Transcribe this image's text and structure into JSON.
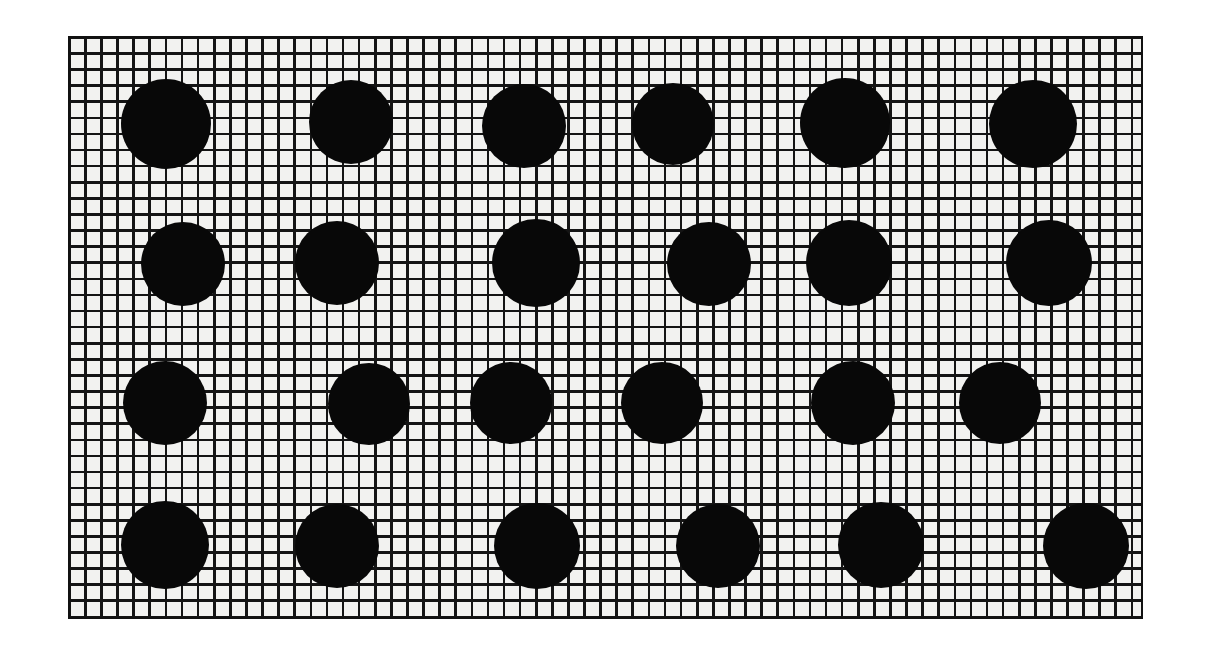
{
  "scene": {
    "title": "Black mesh grid with array of solid black dots",
    "canvas_width": 1207,
    "canvas_height": 662,
    "background_color": "#ffffff"
  },
  "plate": {
    "name": "grid-plate",
    "x": 68,
    "y": 36,
    "width": 1075,
    "height": 583,
    "cell_size": 16.1,
    "line_width": 2.6,
    "line_color": "#141414",
    "cell_color": "#f2f2f0",
    "border_color": "#111111",
    "border_width": 2.6,
    "columns": 67,
    "rows": 36
  },
  "dots": {
    "name": "dot-array",
    "count": 24,
    "rows": 4,
    "columns": 6,
    "color": "#080808",
    "items": [
      {
        "id": "dot-r1c1",
        "row": 1,
        "col": 1,
        "cx": 166,
        "cy": 124,
        "r": 45
      },
      {
        "id": "dot-r1c2",
        "row": 1,
        "col": 2,
        "cx": 351,
        "cy": 122,
        "r": 42
      },
      {
        "id": "dot-r1c3",
        "row": 1,
        "col": 3,
        "cx": 524,
        "cy": 126,
        "r": 42
      },
      {
        "id": "dot-r1c4",
        "row": 1,
        "col": 4,
        "cx": 673,
        "cy": 124,
        "r": 41
      },
      {
        "id": "dot-r1c5",
        "row": 1,
        "col": 5,
        "cx": 845,
        "cy": 123,
        "r": 45
      },
      {
        "id": "dot-r1c6",
        "row": 1,
        "col": 6,
        "cx": 1033,
        "cy": 124,
        "r": 44
      },
      {
        "id": "dot-r2c1",
        "row": 2,
        "col": 1,
        "cx": 183,
        "cy": 264,
        "r": 42
      },
      {
        "id": "dot-r2c2",
        "row": 2,
        "col": 2,
        "cx": 337,
        "cy": 263,
        "r": 42
      },
      {
        "id": "dot-r2c3",
        "row": 2,
        "col": 3,
        "cx": 536,
        "cy": 263,
        "r": 44
      },
      {
        "id": "dot-r2c4",
        "row": 2,
        "col": 4,
        "cx": 709,
        "cy": 264,
        "r": 42
      },
      {
        "id": "dot-r2c5",
        "row": 2,
        "col": 5,
        "cx": 849,
        "cy": 263,
        "r": 43
      },
      {
        "id": "dot-r2c6",
        "row": 2,
        "col": 6,
        "cx": 1049,
        "cy": 263,
        "r": 43
      },
      {
        "id": "dot-r3c1",
        "row": 3,
        "col": 1,
        "cx": 165,
        "cy": 403,
        "r": 42
      },
      {
        "id": "dot-r3c2",
        "row": 3,
        "col": 2,
        "cx": 369,
        "cy": 404,
        "r": 41
      },
      {
        "id": "dot-r3c3",
        "row": 3,
        "col": 3,
        "cx": 511,
        "cy": 403,
        "r": 41
      },
      {
        "id": "dot-r3c4",
        "row": 3,
        "col": 4,
        "cx": 662,
        "cy": 403,
        "r": 41
      },
      {
        "id": "dot-r3c5",
        "row": 3,
        "col": 5,
        "cx": 853,
        "cy": 403,
        "r": 42
      },
      {
        "id": "dot-r3c6",
        "row": 3,
        "col": 6,
        "cx": 1000,
        "cy": 403,
        "r": 41
      },
      {
        "id": "dot-r4c1",
        "row": 4,
        "col": 1,
        "cx": 165,
        "cy": 545,
        "r": 44
      },
      {
        "id": "dot-r4c2",
        "row": 4,
        "col": 2,
        "cx": 337,
        "cy": 546,
        "r": 42
      },
      {
        "id": "dot-r4c3",
        "row": 4,
        "col": 3,
        "cx": 537,
        "cy": 546,
        "r": 43
      },
      {
        "id": "dot-r4c4",
        "row": 4,
        "col": 4,
        "cx": 718,
        "cy": 546,
        "r": 42
      },
      {
        "id": "dot-r4c5",
        "row": 4,
        "col": 5,
        "cx": 881,
        "cy": 545,
        "r": 43
      },
      {
        "id": "dot-r4c6",
        "row": 4,
        "col": 6,
        "cx": 1086,
        "cy": 546,
        "r": 43
      }
    ]
  }
}
